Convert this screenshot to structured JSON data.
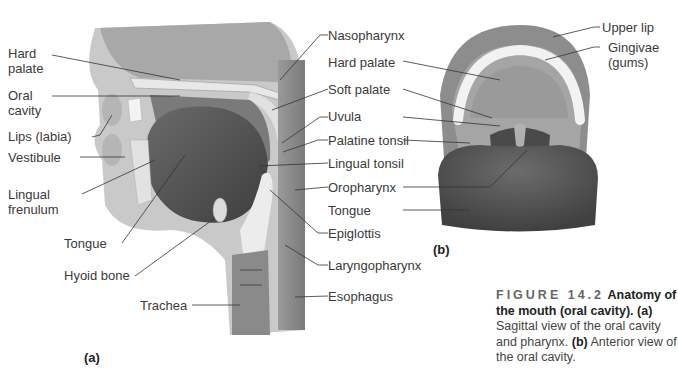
{
  "figure": {
    "number": "FIGURE 14.2",
    "title": "Anatomy of the mouth (oral cavity).",
    "caption_a_tag": "(a)",
    "caption_a_text": "Sagittal view of the oral cavity and pharynx.",
    "caption_b_tag": "(b)",
    "caption_b_text": "Anterior view of the oral cavity."
  },
  "panel_a": {
    "tag": "(a)",
    "title": "Sagittal view",
    "left_labels": [
      {
        "text": "Hard",
        "text2": "palate"
      },
      {
        "text": "Oral",
        "text2": "cavity"
      },
      {
        "text": "Lips (labia)"
      },
      {
        "text": "Vestibule"
      },
      {
        "text": "Lingual",
        "text2": "frenulum"
      },
      {
        "text": "Tongue"
      },
      {
        "text": "Hyoid bone"
      },
      {
        "text": "Trachea"
      }
    ],
    "right_labels": [
      {
        "text": "Nasopharynx"
      },
      {
        "text": "Soft palate"
      },
      {
        "text": "Uvula"
      },
      {
        "text": "Palatine tonsil"
      },
      {
        "text": "Lingual tonsil"
      },
      {
        "text": "Oropharynx"
      },
      {
        "text": "Epiglottis"
      },
      {
        "text": "Laryngopharynx"
      },
      {
        "text": "Esophagus"
      }
    ]
  },
  "panel_b": {
    "tag": "(b)",
    "title": "Anterior view",
    "center_labels": [
      {
        "text": "Hard palate"
      },
      {
        "text": "Soft palate"
      },
      {
        "text": "Uvula"
      },
      {
        "text": "Palatine tonsil"
      },
      {
        "text": "Oropharynx"
      },
      {
        "text": "Tongue"
      }
    ],
    "right_labels": [
      {
        "text": "Upper lip"
      },
      {
        "text": "Gingivae",
        "text2": "(gums)"
      }
    ]
  },
  "colors": {
    "tissue_dark": "#5a5a5a",
    "tissue_mid": "#8c8c8c",
    "tissue_light": "#c8c8c8",
    "bone": "#e6e6e6",
    "leader": "#333333"
  }
}
